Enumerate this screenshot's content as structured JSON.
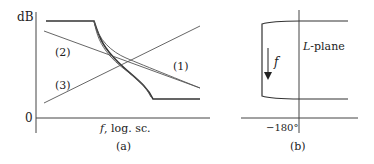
{
  "panel_a": {
    "y_axis_label": "dB",
    "zero_label": "0",
    "x_axis_label_var": "f",
    "x_axis_label_rest": ", log. sc.",
    "caption": "(a)",
    "curve_labels": {
      "curve1": "(1)",
      "curve2": "(2)",
      "curve3": "(3)"
    }
  },
  "panel_b": {
    "plane_label_var": "L",
    "plane_label_rest": "-plane",
    "arrow_label": "f",
    "x_tick_label": "−180°",
    "caption": "(b)"
  },
  "colors": {
    "line": "#333333",
    "thin_line": "#555555",
    "text": "#222222"
  }
}
